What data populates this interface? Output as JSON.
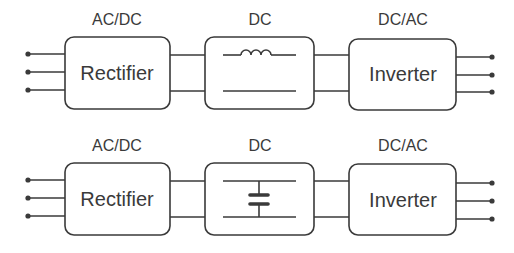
{
  "diagram": {
    "colors": {
      "stroke": "#3a3a3a",
      "background": "#ffffff"
    },
    "rows": [
      {
        "name": "inductor-dc-link",
        "blocks": [
          {
            "label": "AC/DC",
            "title": "Rectifier"
          },
          {
            "label": "DC",
            "title": "",
            "element": "inductor-icon"
          },
          {
            "label": "DC/AC",
            "title": "Inverter"
          }
        ]
      },
      {
        "name": "capacitor-dc-link",
        "blocks": [
          {
            "label": "AC/DC",
            "title": "Rectifier"
          },
          {
            "label": "DC",
            "title": "",
            "element": "capacitor-icon"
          },
          {
            "label": "DC/AC",
            "title": "Inverter"
          }
        ]
      }
    ]
  }
}
